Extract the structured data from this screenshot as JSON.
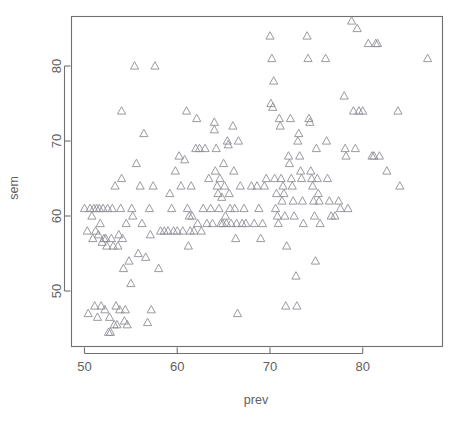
{
  "chart_data": {
    "type": "scatter",
    "title": "",
    "xlabel": "prev",
    "ylabel": "sem",
    "xlim": [
      48.6,
      88.6
    ],
    "ylim": [
      42.6,
      86.6
    ],
    "xticks": [
      50,
      60,
      70,
      80
    ],
    "yticks": [
      50,
      60,
      70,
      80
    ],
    "xtick_labels": [
      "50",
      "60",
      "70",
      "80"
    ],
    "ytick_labels": [
      "50",
      "60",
      "70",
      "80"
    ],
    "grid": false,
    "legend": false,
    "marker": "open-triangle",
    "marker_color": "#8e8e96",
    "frame": "box",
    "n_points": 214,
    "series": [
      {
        "name": "sem vs prev",
        "points": [
          [
            50.0,
            61.0
          ],
          [
            50.3,
            58.0
          ],
          [
            50.4,
            47.0
          ],
          [
            50.6,
            61.0
          ],
          [
            50.8,
            60.0
          ],
          [
            50.9,
            57.0
          ],
          [
            51.0,
            61.0
          ],
          [
            51.1,
            48.0
          ],
          [
            51.2,
            58.0
          ],
          [
            51.3,
            61.0
          ],
          [
            51.4,
            46.5
          ],
          [
            51.5,
            57.5
          ],
          [
            51.6,
            61.0
          ],
          [
            51.7,
            59.0
          ],
          [
            51.8,
            48.0
          ],
          [
            51.9,
            56.5
          ],
          [
            52.0,
            61.0
          ],
          [
            52.1,
            57.0
          ],
          [
            52.2,
            47.5
          ],
          [
            52.3,
            57.0
          ],
          [
            52.4,
            56.0
          ],
          [
            52.5,
            61.0
          ],
          [
            52.6,
            44.5
          ],
          [
            52.7,
            46.5
          ],
          [
            52.8,
            44.5
          ],
          [
            52.9,
            57.0
          ],
          [
            53.0,
            61.0
          ],
          [
            53.1,
            56.0
          ],
          [
            53.2,
            45.5
          ],
          [
            53.3,
            64.0
          ],
          [
            53.4,
            48.0
          ],
          [
            53.5,
            45.5
          ],
          [
            53.6,
            56.0
          ],
          [
            53.7,
            57.5
          ],
          [
            53.8,
            47.5
          ],
          [
            53.9,
            61.0
          ],
          [
            54.0,
            65.0
          ],
          [
            54.0,
            74.0
          ],
          [
            54.1,
            57.0
          ],
          [
            54.2,
            53.0
          ],
          [
            54.3,
            46.0
          ],
          [
            54.4,
            47.5
          ],
          [
            54.5,
            59.0
          ],
          [
            54.6,
            45.5
          ],
          [
            54.8,
            54.0
          ],
          [
            55.0,
            51.0
          ],
          [
            55.1,
            61.0
          ],
          [
            55.2,
            60.0
          ],
          [
            55.4,
            80.0
          ],
          [
            55.6,
            67.0
          ],
          [
            55.8,
            55.0
          ],
          [
            56.0,
            64.0
          ],
          [
            56.2,
            59.0
          ],
          [
            56.4,
            71.0
          ],
          [
            56.6,
            54.5
          ],
          [
            56.8,
            45.8
          ],
          [
            57.0,
            61.0
          ],
          [
            57.1,
            57.5
          ],
          [
            57.2,
            47.5
          ],
          [
            57.4,
            64.0
          ],
          [
            57.6,
            80.0
          ],
          [
            58.0,
            53.0
          ],
          [
            58.2,
            58.0
          ],
          [
            58.6,
            58.0
          ],
          [
            59.0,
            58.0
          ],
          [
            59.2,
            63.0
          ],
          [
            59.4,
            61.0
          ],
          [
            59.6,
            58.0
          ],
          [
            59.8,
            66.0
          ],
          [
            60.0,
            58.0
          ],
          [
            60.2,
            68.0
          ],
          [
            60.4,
            64.0
          ],
          [
            60.6,
            58.0
          ],
          [
            60.8,
            67.5
          ],
          [
            61.0,
            74.0
          ],
          [
            61.1,
            61.0
          ],
          [
            61.2,
            56.0
          ],
          [
            61.3,
            60.0
          ],
          [
            61.4,
            58.0
          ],
          [
            61.5,
            64.0
          ],
          [
            61.6,
            60.0
          ],
          [
            61.8,
            58.0
          ],
          [
            62.0,
            69.0
          ],
          [
            62.1,
            73.0
          ],
          [
            62.2,
            59.0
          ],
          [
            62.4,
            69.0
          ],
          [
            62.6,
            58.0
          ],
          [
            62.8,
            61.0
          ],
          [
            63.0,
            69.0
          ],
          [
            63.2,
            59.0
          ],
          [
            63.4,
            65.0
          ],
          [
            63.6,
            61.0
          ],
          [
            63.8,
            59.0
          ],
          [
            64.0,
            72.5
          ],
          [
            64.0,
            71.5
          ],
          [
            64.1,
            66.0
          ],
          [
            64.2,
            69.0
          ],
          [
            64.3,
            64.0
          ],
          [
            64.4,
            63.0
          ],
          [
            64.5,
            61.0
          ],
          [
            64.6,
            65.0
          ],
          [
            64.7,
            59.0
          ],
          [
            64.8,
            62.5
          ],
          [
            64.9,
            59.0
          ],
          [
            65.0,
            67.0
          ],
          [
            65.1,
            64.0
          ],
          [
            65.2,
            60.0
          ],
          [
            65.3,
            59.0
          ],
          [
            65.4,
            70.0
          ],
          [
            65.5,
            69.5
          ],
          [
            65.6,
            63.0
          ],
          [
            65.7,
            61.0
          ],
          [
            65.8,
            59.0
          ],
          [
            66.0,
            72.0
          ],
          [
            66.1,
            66.0
          ],
          [
            66.2,
            61.0
          ],
          [
            66.3,
            57.0
          ],
          [
            66.4,
            59.0
          ],
          [
            66.5,
            47.0
          ],
          [
            66.6,
            70.0
          ],
          [
            66.8,
            64.0
          ],
          [
            67.0,
            59.0
          ],
          [
            67.2,
            61.0
          ],
          [
            67.4,
            59.0
          ],
          [
            68.0,
            64.0
          ],
          [
            68.3,
            59.0
          ],
          [
            68.6,
            64.0
          ],
          [
            68.8,
            61.0
          ],
          [
            69.0,
            57.0
          ],
          [
            69.2,
            59.0
          ],
          [
            69.4,
            64.0
          ],
          [
            69.6,
            65.0
          ],
          [
            70.0,
            84.0
          ],
          [
            70.1,
            75.0
          ],
          [
            70.2,
            81.0
          ],
          [
            70.3,
            74.5
          ],
          [
            70.4,
            78.0
          ],
          [
            70.5,
            65.0
          ],
          [
            70.6,
            61.0
          ],
          [
            70.7,
            63.0
          ],
          [
            70.8,
            60.0
          ],
          [
            70.9,
            59.0
          ],
          [
            71.0,
            73.0
          ],
          [
            71.1,
            72.0
          ],
          [
            71.2,
            65.0
          ],
          [
            71.3,
            62.0
          ],
          [
            71.4,
            64.0
          ],
          [
            71.5,
            63.0
          ],
          [
            71.6,
            60.0
          ],
          [
            71.7,
            48.0
          ],
          [
            71.8,
            56.0
          ],
          [
            72.0,
            68.0
          ],
          [
            72.1,
            67.0
          ],
          [
            72.2,
            73.0
          ],
          [
            72.3,
            65.0
          ],
          [
            72.4,
            64.0
          ],
          [
            72.5,
            62.0
          ],
          [
            72.6,
            60.0
          ],
          [
            72.8,
            52.0
          ],
          [
            72.9,
            48.0
          ],
          [
            73.0,
            70.0
          ],
          [
            73.1,
            71.0
          ],
          [
            73.2,
            68.0
          ],
          [
            73.3,
            66.0
          ],
          [
            73.4,
            65.0
          ],
          [
            73.5,
            62.0
          ],
          [
            73.6,
            59.0
          ],
          [
            74.0,
            84.0
          ],
          [
            74.1,
            81.0
          ],
          [
            74.2,
            73.0
          ],
          [
            74.3,
            72.5
          ],
          [
            74.4,
            66.0
          ],
          [
            74.5,
            65.0
          ],
          [
            74.6,
            64.0
          ],
          [
            74.7,
            62.0
          ],
          [
            74.8,
            60.0
          ],
          [
            74.9,
            54.0
          ],
          [
            75.0,
            69.0
          ],
          [
            75.1,
            65.0
          ],
          [
            75.2,
            63.0
          ],
          [
            75.3,
            62.0
          ],
          [
            75.4,
            59.0
          ],
          [
            76.0,
            81.0
          ],
          [
            76.1,
            70.0
          ],
          [
            76.2,
            65.0
          ],
          [
            76.4,
            62.0
          ],
          [
            76.6,
            60.0
          ],
          [
            77.0,
            60.0
          ],
          [
            77.4,
            62.0
          ],
          [
            77.6,
            61.0
          ],
          [
            78.0,
            76.0
          ],
          [
            78.1,
            69.0
          ],
          [
            78.2,
            68.0
          ],
          [
            78.4,
            61.0
          ],
          [
            78.8,
            86.0
          ],
          [
            79.0,
            74.0
          ],
          [
            79.2,
            69.0
          ],
          [
            79.4,
            85.0
          ],
          [
            79.6,
            74.0
          ],
          [
            80.0,
            74.0
          ],
          [
            80.6,
            83.0
          ],
          [
            81.0,
            68.0
          ],
          [
            81.2,
            68.0
          ],
          [
            81.4,
            83.0
          ],
          [
            81.6,
            83.0
          ],
          [
            81.8,
            68.0
          ],
          [
            82.6,
            66.0
          ],
          [
            83.8,
            74.0
          ],
          [
            84.0,
            64.0
          ],
          [
            87.0,
            81.0
          ]
        ]
      }
    ]
  },
  "plot": {
    "x_axis_title": "prev",
    "y_axis_title": "sem",
    "x_tick_labels": [
      "50",
      "60",
      "70",
      "80"
    ],
    "y_tick_labels": [
      "50",
      "60",
      "70",
      "80"
    ]
  }
}
